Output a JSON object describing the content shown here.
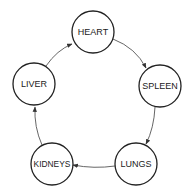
{
  "diagram": {
    "type": "cycle",
    "nodes": [
      {
        "id": "heart",
        "label": "HEART",
        "cx": 93,
        "cy": 32,
        "r": 21
      },
      {
        "id": "spleen",
        "label": "SPLEEN",
        "cx": 160,
        "cy": 86,
        "r": 21
      },
      {
        "id": "lungs",
        "label": "LUNGS",
        "cx": 136,
        "cy": 164,
        "r": 21
      },
      {
        "id": "kidneys",
        "label": "KIDNEYS",
        "cx": 52,
        "cy": 164,
        "r": 21
      },
      {
        "id": "liver",
        "label": "LIVER",
        "cx": 34,
        "cy": 84,
        "r": 21
      }
    ],
    "edges": [
      {
        "from": "heart",
        "to": "spleen"
      },
      {
        "from": "spleen",
        "to": "lungs"
      },
      {
        "from": "lungs",
        "to": "kidneys"
      },
      {
        "from": "kidneys",
        "to": "liver"
      },
      {
        "from": "liver",
        "to": "heart"
      }
    ],
    "colors": {
      "stroke": "#222222",
      "edge": "#555555",
      "background": "#ffffff"
    }
  }
}
